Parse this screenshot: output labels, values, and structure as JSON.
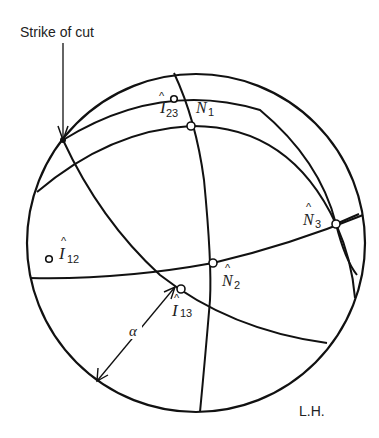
{
  "figure": {
    "caption_strike": "Strike of cut",
    "hemisphere_label": "L.H.",
    "angle_label": "α"
  },
  "points": [
    {
      "id": "I23",
      "symbol": "I",
      "hat": "^",
      "subscript": "23",
      "cx": 172,
      "cy": 96
    },
    {
      "id": "N1",
      "symbol": "N",
      "hat": "",
      "subscript": "1",
      "cx": 191,
      "cy": 126
    },
    {
      "id": "N3",
      "symbol": "N",
      "hat": "^",
      "subscript": "3",
      "cx": 336,
      "cy": 224
    },
    {
      "id": "I12",
      "symbol": "I",
      "hat": "^",
      "subscript": "12",
      "cx": 49,
      "cy": 259
    },
    {
      "id": "N2",
      "symbol": "N",
      "hat": "^",
      "subscript": "2",
      "cx": 213,
      "cy": 263
    },
    {
      "id": "I13",
      "symbol": "I",
      "hat": "^",
      "subscript": "13",
      "cx": 181,
      "cy": 289
    }
  ],
  "colors": {
    "line": "#111111",
    "background": "#ffffff"
  }
}
